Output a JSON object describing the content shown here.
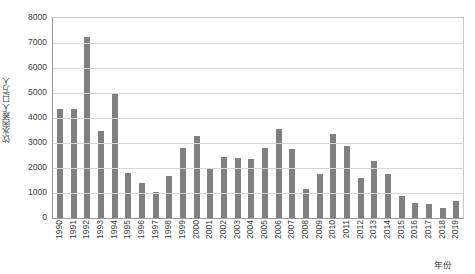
{
  "chart_data": {
    "type": "bar",
    "title": "",
    "xlabel": "年份",
    "ylabel": "饮水困难人口/万人",
    "ylim": [
      0,
      8000
    ],
    "ytick_step": 1000,
    "yticks": [
      "8000",
      "7000",
      "6000",
      "5000",
      "4000",
      "3000",
      "2000",
      "1000",
      "0"
    ],
    "grid": true,
    "legend": "none",
    "bar_color": "#808080",
    "categories": [
      "1990",
      "1991",
      "1992",
      "1993",
      "1994",
      "1995",
      "1996",
      "1997",
      "1998",
      "1999",
      "2000",
      "2001",
      "2002",
      "2003",
      "2004",
      "2005",
      "2006",
      "2007",
      "2008",
      "2009",
      "2010",
      "2011",
      "2012",
      "2013",
      "2014",
      "2015",
      "2016",
      "2017",
      "2018",
      "2019"
    ],
    "values": [
      4380,
      4370,
      7250,
      3500,
      4980,
      1800,
      1400,
      1050,
      1700,
      2800,
      3300,
      2000,
      2450,
      2400,
      2380,
      2800,
      3550,
      2750,
      1150,
      1750,
      3350,
      2900,
      1600,
      2300,
      1780,
      880,
      590,
      560,
      420,
      700
    ]
  }
}
